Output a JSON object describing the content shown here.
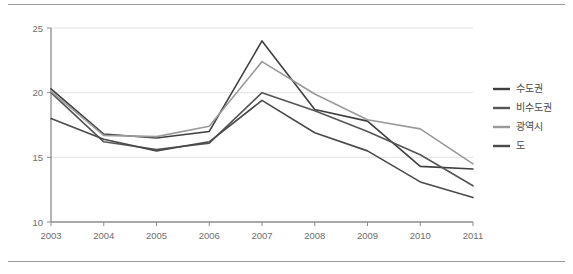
{
  "chart_data": {
    "type": "line",
    "title": "",
    "subtitle": "",
    "xlabel": "",
    "ylabel": "",
    "categories": [
      "2003",
      "2004",
      "2005",
      "2006",
      "2007",
      "2008",
      "2009",
      "2010",
      "2011"
    ],
    "x": [
      2003,
      2004,
      2005,
      2006,
      2007,
      2008,
      2009,
      2010,
      2011
    ],
    "ylim": [
      10,
      25
    ],
    "yticks": [
      10,
      15,
      20,
      25
    ],
    "ytick_labels": [
      "10",
      "15",
      "20",
      "25"
    ],
    "grid": "horizontal",
    "legend_position": "right",
    "series": [
      {
        "name": "수도권",
        "color": "#3f3f3f",
        "values": [
          20.3,
          16.8,
          16.5,
          17.0,
          24.0,
          18.7,
          17.8,
          14.3,
          14.1
        ]
      },
      {
        "name": "비수도권",
        "color": "#555555",
        "values": [
          20.0,
          16.2,
          15.6,
          16.1,
          20.0,
          18.6,
          17.0,
          15.2,
          12.8
        ]
      },
      {
        "name": "광역시",
        "color": "#9a9a9a",
        "values": [
          20.1,
          16.7,
          16.6,
          17.4,
          22.4,
          19.9,
          17.9,
          17.2,
          14.5
        ]
      },
      {
        "name": "도",
        "color": "#4a4a4a",
        "values": [
          18.0,
          16.4,
          15.5,
          16.2,
          19.4,
          16.9,
          15.5,
          13.1,
          11.9
        ]
      }
    ]
  },
  "legend": {
    "entries": [
      {
        "label": "수도권",
        "color": "#3f3f3f"
      },
      {
        "label": "비수도권",
        "color": "#555555"
      },
      {
        "label": "광역시",
        "color": "#9a9a9a"
      },
      {
        "label": "도",
        "color": "#4a4a4a"
      }
    ]
  },
  "axes": {
    "y_tick_labels": [
      "25",
      "20",
      "15",
      "10"
    ],
    "x_tick_labels": [
      "2003",
      "2004",
      "2005",
      "2006",
      "2007",
      "2008",
      "2009",
      "2010",
      "2011"
    ]
  },
  "colors": {
    "axis": "#8c8c8c",
    "gridline": "#e2e2e2",
    "rule": "#9a9a9a",
    "tick_text": "#6e6e6e",
    "legend_text": "#4a4a4a"
  }
}
